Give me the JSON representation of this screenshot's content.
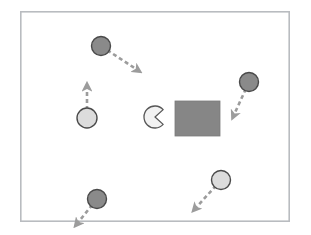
{
  "scene": {
    "title": "Multi-agent navigation simulation snapshot",
    "width": 311,
    "height": 235,
    "background_color": "#ffffff"
  },
  "frame": {
    "label": "simulation-boundary",
    "x": 20,
    "y": 11,
    "width": 270,
    "height": 211,
    "stroke_color": "#b9bcc0",
    "fill_color": "#ffffff",
    "stroke_width": 1.6
  },
  "obstacle": {
    "label": "rectangular obstacle",
    "x": 175,
    "y": 101,
    "width": 45,
    "height": 35,
    "fill_color": "#868686",
    "stroke_color": "#7a7a7a"
  },
  "ego_agent": {
    "label": "pacman agent",
    "cx": 155,
    "cy": 117,
    "r": 11,
    "mouth_direction_deg": 0,
    "mouth_half_angle_deg": 42,
    "fill_color": "#f2f2f2",
    "stroke_color": "#575757"
  },
  "agents": [
    {
      "id": "agent-1",
      "label": "dark agent upper-left",
      "cx": 101,
      "cy": 46,
      "r": 9.5,
      "fill_color": "#8a8a8a",
      "stroke_color": "#4a4a4a",
      "velocity": {
        "dx": 38,
        "dy": 25,
        "direction": "down-right",
        "arrow_color": "#9c9c9c"
      }
    },
    {
      "id": "agent-2",
      "label": "light agent left with upward velocity",
      "cx": 87,
      "cy": 118,
      "r": 10,
      "fill_color": "#dcdcdc",
      "stroke_color": "#4a4a4a",
      "velocity": {
        "dx": 0,
        "dy": -33,
        "direction": "up",
        "arrow_color": "#9c9c9c"
      }
    },
    {
      "id": "agent-3",
      "label": "dark agent right",
      "cx": 249,
      "cy": 82,
      "r": 9.5,
      "fill_color": "#8a8a8a",
      "stroke_color": "#4a4a4a",
      "velocity": {
        "dx": -16,
        "dy": 35,
        "direction": "down-left",
        "arrow_color": "#9c9c9c"
      }
    },
    {
      "id": "agent-4",
      "label": "light agent lower-right",
      "cx": 221,
      "cy": 180,
      "r": 9.5,
      "fill_color": "#dcdcdc",
      "stroke_color": "#4a4a4a",
      "velocity": {
        "dx": -27,
        "dy": 30,
        "direction": "down-left",
        "arrow_color": "#9c9c9c"
      }
    },
    {
      "id": "agent-5",
      "label": "dark agent lower-left",
      "cx": 97,
      "cy": 199,
      "r": 9.5,
      "fill_color": "#8a8a8a",
      "stroke_color": "#4a4a4a",
      "velocity": {
        "dx": -21,
        "dy": 26,
        "direction": "down-left",
        "arrow_color": "#9c9c9c"
      }
    }
  ]
}
